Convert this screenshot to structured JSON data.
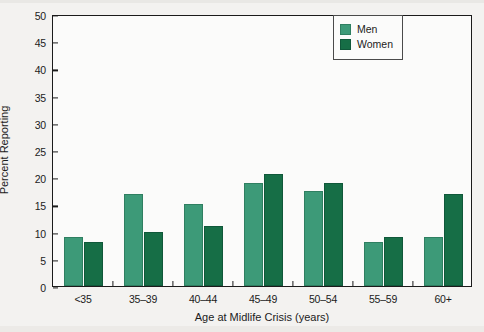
{
  "chart_data": {
    "type": "bar",
    "title": "",
    "xlabel": "Age at Midlife Crisis (years)",
    "ylabel": "Percent Reporting",
    "categories": [
      "<35",
      "35–39",
      "40–44",
      "45–49",
      "50–54",
      "55–59",
      "60+"
    ],
    "series": [
      {
        "name": "Men",
        "color": "#3d9a78",
        "values": [
          9,
          17,
          15,
          19,
          17.5,
          8,
          9
        ]
      },
      {
        "name": "Women",
        "color": "#166e46",
        "values": [
          8,
          10,
          11,
          20.5,
          19,
          9,
          17
        ]
      }
    ],
    "ylim": [
      0,
      50
    ],
    "yticks": [
      0,
      5,
      10,
      15,
      20,
      25,
      30,
      35,
      40,
      45,
      50
    ],
    "ytick_labels": [
      "0",
      "5",
      "10",
      "15",
      "20",
      "25",
      "30",
      "35",
      "40",
      "45",
      "50"
    ],
    "grid": false,
    "legend_position": "top-right"
  },
  "legend": {
    "entries": [
      {
        "label": "Men"
      },
      {
        "label": "Women"
      }
    ]
  }
}
